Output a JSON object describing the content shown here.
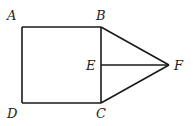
{
  "diagram": {
    "type": "geometry-figure",
    "points": {
      "A": {
        "label": "A",
        "x": 22,
        "y": 27
      },
      "B": {
        "label": "B",
        "x": 101,
        "y": 27
      },
      "C": {
        "label": "C",
        "x": 101,
        "y": 103
      },
      "D": {
        "label": "D",
        "x": 22,
        "y": 103
      },
      "E": {
        "label": "E",
        "x": 101,
        "y": 65
      },
      "F": {
        "label": "F",
        "x": 169,
        "y": 65
      }
    },
    "segments": [
      [
        "A",
        "B"
      ],
      [
        "B",
        "C"
      ],
      [
        "C",
        "D"
      ],
      [
        "D",
        "A"
      ],
      [
        "B",
        "F"
      ],
      [
        "C",
        "F"
      ],
      [
        "E",
        "F"
      ]
    ],
    "line_color": "#1a1a1a"
  }
}
